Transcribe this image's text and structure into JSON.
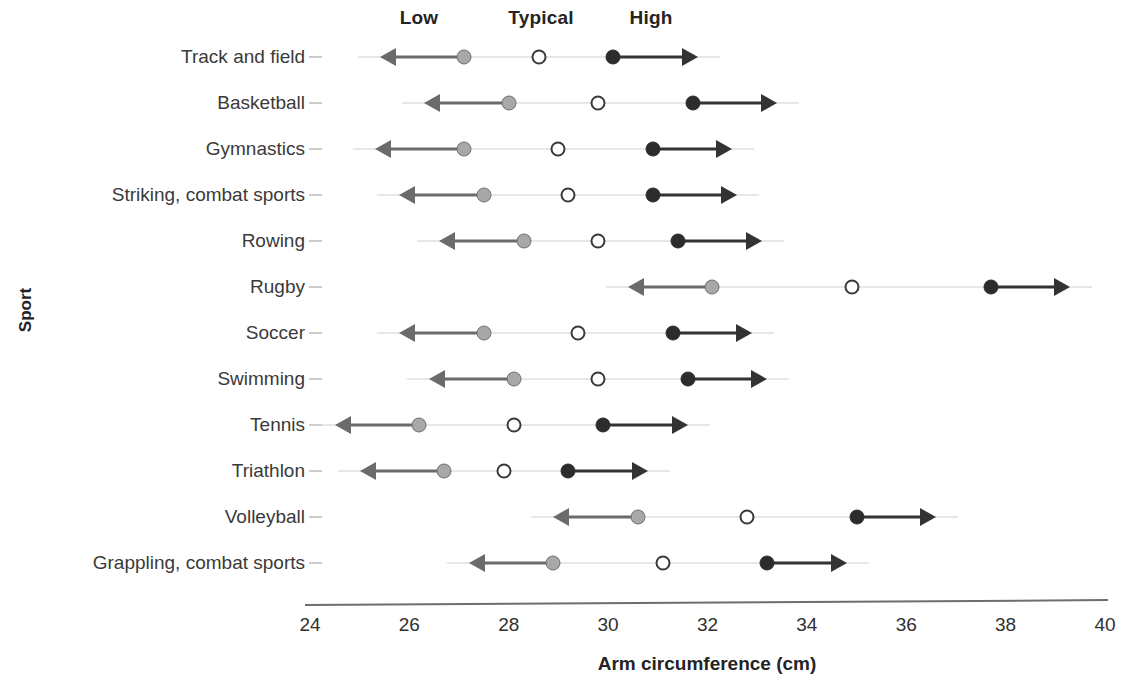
{
  "chart_data": {
    "type": "scatter",
    "title": "",
    "xlabel": "Arm circumference (cm)",
    "ylabel": "Sport",
    "xlim": [
      24,
      40
    ],
    "xticks": [
      24,
      26,
      28,
      30,
      32,
      34,
      36,
      38,
      40
    ],
    "grid": false,
    "legend_position": "top",
    "column_headers": [
      {
        "label": "Low",
        "x_px": 419
      },
      {
        "label": "Typical",
        "x_px": 541
      },
      {
        "label": "High",
        "x_px": 651
      }
    ],
    "series": [
      {
        "name": "Low",
        "marker": "filled-gray-circle",
        "color": "#a8a8a8",
        "arrow": "left"
      },
      {
        "name": "Typical",
        "marker": "open-circle",
        "color": "#ffffff",
        "arrow": "none"
      },
      {
        "name": "High",
        "marker": "filled-black-circle",
        "color": "#2c2c2c",
        "arrow": "right"
      }
    ],
    "categories": [
      "Track and field",
      "Basketball",
      "Gymnastics",
      "Striking, combat sports",
      "Rowing",
      "Rugby",
      "Soccer",
      "Swimming",
      "Tennis",
      "Triathlon",
      "Volleyball",
      "Grappling, combat sports"
    ],
    "rows": [
      {
        "sport": "Track and field",
        "low": 27.1,
        "typical": 28.6,
        "high": 30.1,
        "low_arrow_end": 25.4,
        "high_arrow_end": 31.8
      },
      {
        "sport": "Basketball",
        "low": 28.0,
        "typical": 29.8,
        "high": 31.7,
        "low_arrow_end": 26.3,
        "high_arrow_end": 33.4
      },
      {
        "sport": "Gymnastics",
        "low": 27.1,
        "typical": 29.0,
        "high": 30.9,
        "low_arrow_end": 25.3,
        "high_arrow_end": 32.5
      },
      {
        "sport": "Striking, combat sports",
        "low": 27.5,
        "typical": 29.2,
        "high": 30.9,
        "low_arrow_end": 25.8,
        "high_arrow_end": 32.6
      },
      {
        "sport": "Rowing",
        "low": 28.3,
        "typical": 29.8,
        "high": 31.4,
        "low_arrow_end": 26.6,
        "high_arrow_end": 33.1
      },
      {
        "sport": "Rugby",
        "low": 32.1,
        "typical": 34.9,
        "high": 37.7,
        "low_arrow_end": 30.4,
        "high_arrow_end": 39.3
      },
      {
        "sport": "Soccer",
        "low": 27.5,
        "typical": 29.4,
        "high": 31.3,
        "low_arrow_end": 25.8,
        "high_arrow_end": 32.9
      },
      {
        "sport": "Swimming",
        "low": 28.1,
        "typical": 29.8,
        "high": 31.6,
        "low_arrow_end": 26.4,
        "high_arrow_end": 33.2
      },
      {
        "sport": "Tennis",
        "low": 26.2,
        "typical": 28.1,
        "high": 29.9,
        "low_arrow_end": 24.5,
        "high_arrow_end": 31.6
      },
      {
        "sport": "Triathlon",
        "low": 26.7,
        "typical": 27.9,
        "high": 29.2,
        "low_arrow_end": 25.0,
        "high_arrow_end": 30.8
      },
      {
        "sport": "Volleyball",
        "low": 30.6,
        "typical": 32.8,
        "high": 35.0,
        "low_arrow_end": 28.9,
        "high_arrow_end": 36.6
      },
      {
        "sport": "Grappling, combat sports",
        "low": 28.9,
        "typical": 31.1,
        "high": 33.2,
        "low_arrow_end": 27.2,
        "high_arrow_end": 34.8
      }
    ]
  },
  "axis": {
    "x_title": "Arm circumference (cm)",
    "y_title": "Sport",
    "x_tick_labels": [
      "24",
      "26",
      "28",
      "30",
      "32",
      "34",
      "36",
      "38",
      "40"
    ]
  },
  "colors": {
    "low": "#a8a8a8",
    "low_stroke": "#6e6e6e",
    "typical_stroke": "#3a3a3a",
    "high": "#2c2c2c",
    "axis": "#6e6e6e",
    "baseline": "#cfcfcf",
    "text": "#2b2b2b",
    "background": "#ffffff"
  }
}
